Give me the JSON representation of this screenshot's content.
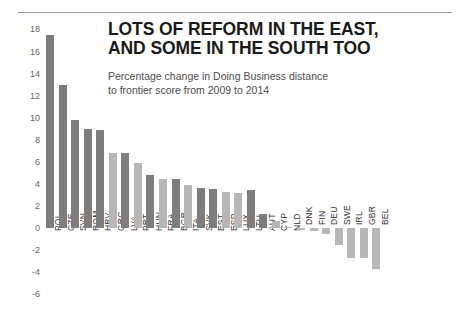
{
  "header": {
    "title_line1": "LOTS OF REFORM IN THE EAST,",
    "title_line2": "AND SOME IN THE SOUTH TOO",
    "subtitle_line1": "Percentage change in Doing Business distance",
    "subtitle_line2": "to frontier score from 2009 to 2014"
  },
  "colors": {
    "bar_dark": "#7d7d7d",
    "bar_light": "#b7b7b7",
    "rule": "#9a9a9a",
    "title_text": "#1a1a1a",
    "subtitle_text": "#4d4d4d",
    "axis_text": "#666666",
    "label_text": "#333333"
  },
  "chart_data": {
    "type": "bar",
    "title": "LOTS OF REFORM IN THE EAST, AND SOME IN THE SOUTH TOO",
    "subtitle": "Percentage change in Doing Business distance to frontier score from 2009 to 2014",
    "xlabel": "",
    "ylabel": "",
    "ylim": [
      -6,
      18
    ],
    "yticks": [
      18,
      16,
      14,
      12,
      10,
      8,
      6,
      4,
      2,
      0,
      -2,
      -4,
      -6
    ],
    "grid": false,
    "legend": "none",
    "categories": [
      "POL",
      "CZE",
      "SVN",
      "ROM",
      "HRV",
      "GRC",
      "LVA",
      "PRT",
      "HUN",
      "FRA",
      "BGR",
      "ITA",
      "SVK",
      "EST",
      "ESP",
      "LUX",
      "LTU",
      "AUT",
      "CYP",
      "NLD",
      "DNK",
      "FIN",
      "DEU",
      "SWE",
      "IRL",
      "GBR",
      "BEL"
    ],
    "values": [
      17.5,
      13.0,
      9.8,
      9.0,
      8.9,
      6.8,
      6.8,
      5.9,
      4.8,
      4.4,
      4.4,
      3.9,
      3.6,
      3.5,
      3.3,
      3.2,
      3.4,
      1.3,
      0.6,
      0.1,
      -0.15,
      -0.3,
      -0.5,
      -1.5,
      -2.7,
      -2.7,
      -3.7
    ],
    "shades": [
      "dark",
      "dark",
      "dark",
      "dark",
      "dark",
      "light",
      "dark",
      "light",
      "dark",
      "light",
      "dark",
      "light",
      "dark",
      "dark",
      "light",
      "light",
      "dark",
      "dark",
      "light",
      "light",
      "light",
      "light",
      "light",
      "light",
      "light",
      "light",
      "light"
    ]
  }
}
